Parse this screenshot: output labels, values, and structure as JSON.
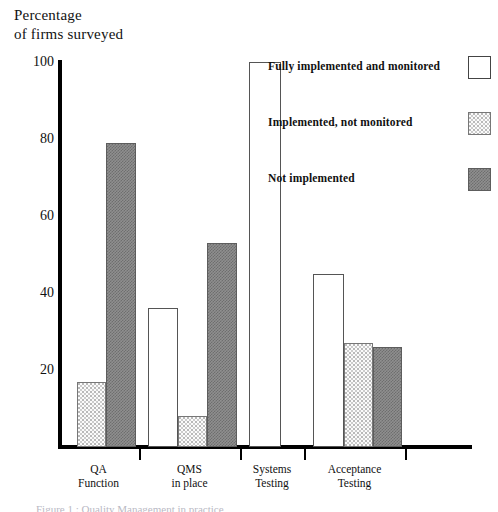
{
  "axis_title": "Percentage\nof firms surveyed",
  "bottom_caption": "Figure 1 : Quality Management in practice",
  "legend": {
    "position": "top-right",
    "entries": [
      {
        "label": "Fully implemented and monitored",
        "swatch": "white-open-square-icon",
        "style": "white"
      },
      {
        "label": "Implemented, not monitored",
        "swatch": "dotted-square-icon",
        "style": "dotted"
      },
      {
        "label": "Not implemented",
        "swatch": "crosshatch-square-icon",
        "style": "dark"
      }
    ]
  },
  "chart_data": {
    "type": "bar",
    "title": "",
    "xlabel": "",
    "ylabel": "Percentage of firms surveyed",
    "ylim": [
      0,
      100
    ],
    "yticks": [
      20,
      40,
      60,
      80,
      100
    ],
    "ytick_labels": [
      "20",
      "40",
      "60",
      "80",
      "100"
    ],
    "grid": false,
    "legend_position": "top-right",
    "categories": [
      "QA\nFunction",
      "QMS\nin place",
      "Systems\nTesting",
      "Acceptance\nTesting"
    ],
    "category_lines": [
      [
        "QA",
        "Function"
      ],
      [
        "QMS",
        "in place"
      ],
      [
        "Systems",
        "Testing"
      ],
      [
        "Acceptance",
        "Testing"
      ]
    ],
    "series": [
      {
        "name": "Fully implemented and monitored",
        "style": "white",
        "values": [
          null,
          36,
          100,
          45
        ]
      },
      {
        "name": "Implemented, not monitored",
        "style": "dotted",
        "values": [
          17,
          8,
          null,
          27
        ]
      },
      {
        "name": "Not implemented",
        "style": "dark",
        "values": [
          79,
          53,
          null,
          26
        ]
      }
    ]
  },
  "bars": [
    {
      "name": "bar-qa-function-implemented-not-monitored",
      "group": "QA Function",
      "series": "Implemented, not monitored",
      "style": "dotted",
      "value": 17,
      "x": 77,
      "w": 29
    },
    {
      "name": "bar-qa-function-not-implemented",
      "group": "QA Function",
      "series": "Not implemented",
      "style": "dark",
      "value": 79,
      "x": 106,
      "w": 30
    },
    {
      "name": "bar-qms-in-place-fully-implemented",
      "group": "QMS in place",
      "series": "Fully implemented and monitored",
      "style": "white",
      "value": 36,
      "x": 148,
      "w": 30
    },
    {
      "name": "bar-qms-in-place-implemented-not-monitored",
      "group": "QMS in place",
      "series": "Implemented, not monitored",
      "style": "dotted",
      "value": 8,
      "x": 178,
      "w": 29
    },
    {
      "name": "bar-qms-in-place-not-implemented",
      "group": "QMS in place",
      "series": "Not implemented",
      "style": "dark",
      "value": 53,
      "x": 207,
      "w": 30
    },
    {
      "name": "bar-systems-testing-fully-implemented",
      "group": "Systems Testing",
      "series": "Fully implemented and monitored",
      "style": "white",
      "value": 100,
      "x": 249,
      "w": 32
    },
    {
      "name": "bar-acceptance-testing-fully-implemented",
      "group": "Acceptance Testing",
      "series": "Fully implemented and monitored",
      "style": "white",
      "value": 45,
      "x": 313,
      "w": 31
    },
    {
      "name": "bar-acceptance-testing-implemented-not-monitored",
      "group": "Acceptance Testing",
      "series": "Implemented, not monitored",
      "style": "dotted",
      "value": 27,
      "x": 344,
      "w": 29
    },
    {
      "name": "bar-acceptance-testing-not-implemented",
      "group": "Acceptance Testing",
      "series": "Not implemented",
      "style": "dark",
      "value": 26,
      "x": 373,
      "w": 29
    }
  ],
  "x_ticks": [
    {
      "label": "QA Function",
      "x": 139
    },
    {
      "label": "QMS in place",
      "x": 240
    },
    {
      "label": "Systems Testing",
      "x": 304
    },
    {
      "label": "Acceptance Testing",
      "x": 405
    }
  ],
  "geometry": {
    "baseline_y": 447,
    "top_y": 62,
    "y_max": 100,
    "px_per_unit": 3.85
  }
}
